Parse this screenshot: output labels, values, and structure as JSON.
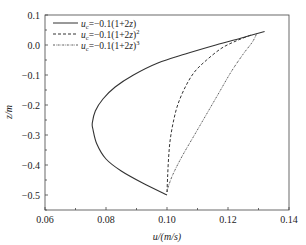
{
  "chart_data": {
    "type": "line",
    "title": "",
    "xlabel": "u/(m/s)",
    "ylabel": "z/m",
    "xlim": [
      0.06,
      0.14
    ],
    "ylim": [
      -0.55,
      0.1
    ],
    "xticks": [
      "0.06",
      "0.08",
      "0.10",
      "0.12",
      "0.14"
    ],
    "yticks": [
      "0.1",
      "0.0",
      "-0.1",
      "-0.2",
      "-0.3",
      "-0.4",
      "-0.5"
    ],
    "grid": false,
    "legend_position": "upper left",
    "series": [
      {
        "name": "u_c=-0.1(1+2z)",
        "style": "solid",
        "points": [
          [
            0.1,
            -0.5
          ],
          [
            0.092,
            -0.46
          ],
          [
            0.085,
            -0.42
          ],
          [
            0.08,
            -0.38
          ],
          [
            0.077,
            -0.33
          ],
          [
            0.0757,
            -0.28
          ],
          [
            0.0755,
            -0.26
          ],
          [
            0.0765,
            -0.22
          ],
          [
            0.079,
            -0.18
          ],
          [
            0.083,
            -0.14
          ],
          [
            0.089,
            -0.1
          ],
          [
            0.097,
            -0.06
          ],
          [
            0.106,
            -0.03
          ],
          [
            0.116,
            0.0
          ],
          [
            0.125,
            0.025
          ],
          [
            0.132,
            0.045
          ]
        ]
      },
      {
        "name": "u_c=-0.1(1+2z)^2",
        "style": "dashed",
        "points": [
          [
            0.1,
            -0.49
          ],
          [
            0.1002,
            -0.44
          ],
          [
            0.1005,
            -0.38
          ],
          [
            0.101,
            -0.32
          ],
          [
            0.102,
            -0.26
          ],
          [
            0.1035,
            -0.2
          ],
          [
            0.106,
            -0.14
          ],
          [
            0.109,
            -0.09
          ],
          [
            0.113,
            -0.05
          ],
          [
            0.118,
            -0.01
          ],
          [
            0.123,
            0.015
          ],
          [
            0.128,
            0.035
          ]
        ]
      },
      {
        "name": "u_c=-0.1(1+2z)^3",
        "style": "dash-dot",
        "points": [
          [
            0.1,
            -0.49
          ],
          [
            0.1005,
            -0.47
          ],
          [
            0.102,
            -0.43
          ],
          [
            0.105,
            -0.37
          ],
          [
            0.109,
            -0.3
          ],
          [
            0.113,
            -0.23
          ],
          [
            0.117,
            -0.16
          ],
          [
            0.121,
            -0.09
          ],
          [
            0.125,
            -0.03
          ],
          [
            0.128,
            0.01
          ],
          [
            0.1295,
            0.04
          ]
        ]
      }
    ]
  },
  "axes": {
    "xlabel": "u/(m/s)",
    "ylabel": "z/m",
    "xticks": [
      "0.06",
      "0.08",
      "0.10",
      "0.12",
      "0.14"
    ],
    "yticks": [
      "0.1",
      "0.0",
      "−0.1",
      "−0.2",
      "−0.3",
      "−0.4",
      "−0.5"
    ]
  },
  "legend": [
    {
      "prefix": "u",
      "sub": "c",
      "expr": "=−0.1(1+2",
      "var": "z",
      "close": ")",
      "sup": ""
    },
    {
      "prefix": "u",
      "sub": "c",
      "expr": "=−0.1(1+2",
      "var": "z",
      "close": ")",
      "sup": "2"
    },
    {
      "prefix": "u",
      "sub": "c",
      "expr": "=−0.1(1+2",
      "var": "z",
      "close": ")",
      "sup": "3"
    }
  ]
}
